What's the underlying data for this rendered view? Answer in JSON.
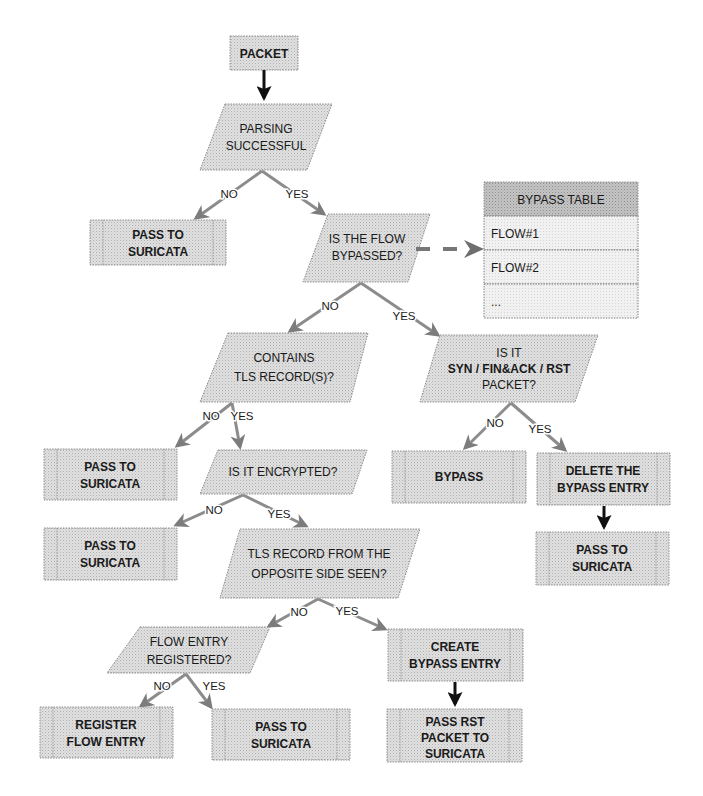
{
  "diagram": {
    "start": {
      "label": "PACKET"
    },
    "decisions": {
      "parsing": {
        "lines": [
          "PARSING",
          "SUCCESSFUL"
        ]
      },
      "bypassed": {
        "lines": [
          "IS THE FLOW",
          "BYPASSED?"
        ]
      },
      "contains_tls": {
        "lines": [
          "CONTAINS",
          "TLS RECORD(S)?"
        ]
      },
      "syn_fin_rst": {
        "lines": [
          "IS IT",
          "SYN / FIN&ACK / RST",
          "PACKET?"
        ]
      },
      "encrypted": {
        "lines": [
          "IS IT ENCRYPTED?"
        ]
      },
      "opposite_side": {
        "lines": [
          "TLS RECORD FROM THE",
          "OPPOSITE SIDE SEEN?"
        ]
      },
      "flow_registered": {
        "lines": [
          "FLOW ENTRY",
          "REGISTERED?"
        ]
      }
    },
    "actions": {
      "pass_1": {
        "lines": [
          "PASS TO",
          "SURICATA"
        ]
      },
      "pass_2": {
        "lines": [
          "PASS TO",
          "SURICATA"
        ]
      },
      "pass_3": {
        "lines": [
          "PASS TO",
          "SURICATA"
        ]
      },
      "pass_4": {
        "lines": [
          "PASS TO",
          "SURICATA"
        ]
      },
      "pass_5": {
        "lines": [
          "PASS TO",
          "SURICATA"
        ]
      },
      "bypass": {
        "lines": [
          "BYPASS"
        ]
      },
      "delete_entry": {
        "lines": [
          "DELETE THE",
          "BYPASS ENTRY"
        ]
      },
      "register_flow": {
        "lines": [
          "REGISTER",
          "FLOW ENTRY"
        ]
      },
      "create_entry": {
        "lines": [
          "CREATE",
          "BYPASS ENTRY"
        ]
      },
      "pass_rst": {
        "lines": [
          "PASS RST",
          "PACKET TO",
          "SURICATA"
        ]
      }
    },
    "branch_labels": {
      "no": "NO",
      "yes": "YES"
    },
    "bypass_table": {
      "title": "BYPASS TABLE",
      "rows": [
        "FLOW#1",
        "FLOW#2",
        "..."
      ]
    },
    "colors": {
      "fill": "#d9d9d9",
      "header_fill": "#b8b8b8",
      "border": "#8a8a8a",
      "branch_arrow": "#8c8c8c",
      "flow_arrow": "#111111"
    }
  }
}
